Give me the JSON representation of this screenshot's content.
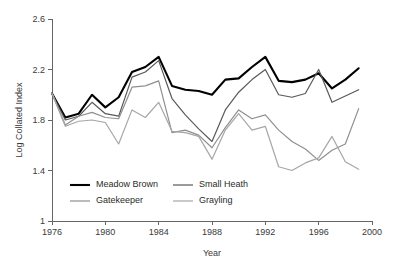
{
  "chart_data": {
    "type": "line",
    "title": "",
    "xlabel": "Year",
    "ylabel": "Log Collated Index",
    "xlim": [
      1976,
      2000
    ],
    "ylim": [
      1,
      2.6
    ],
    "xticks": [
      1976,
      1980,
      1984,
      1988,
      1992,
      1996,
      2000
    ],
    "yticks": [
      1,
      1.4,
      1.8,
      2.2,
      2.6
    ],
    "xtick_labels": [
      "1976",
      "1980",
      "1984",
      "1988",
      "1992",
      "1996",
      "2000"
    ],
    "ytick_labels": [
      "1",
      "1.4",
      "1.8",
      "2.2",
      "2.6"
    ],
    "grid": false,
    "legend_position": "inside-bottom-left",
    "x": [
      1976,
      1977,
      1978,
      1979,
      1980,
      1981,
      1982,
      1983,
      1984,
      1985,
      1986,
      1987,
      1988,
      1989,
      1990,
      1991,
      1992,
      1993,
      1994,
      1995,
      1996,
      1997,
      1998,
      1999
    ],
    "series": [
      {
        "name": "Meadow Brown",
        "color": "#000000",
        "width": 2.1,
        "values": [
          2.01,
          1.82,
          1.85,
          2.0,
          1.9,
          1.98,
          2.18,
          2.22,
          2.3,
          2.07,
          2.04,
          2.03,
          2.0,
          2.12,
          2.13,
          2.22,
          2.3,
          2.11,
          2.1,
          2.12,
          2.17,
          2.05,
          2.12,
          2.21
        ]
      },
      {
        "name": "Small Heath",
        "color": "#595959",
        "width": 1.2,
        "values": [
          2.01,
          1.8,
          1.83,
          1.94,
          1.85,
          1.83,
          2.14,
          2.18,
          2.27,
          1.97,
          1.84,
          1.73,
          1.63,
          1.88,
          2.02,
          2.12,
          2.2,
          2.0,
          1.98,
          2.01,
          2.2,
          1.94,
          1.99,
          2.04
        ]
      },
      {
        "name": "Gatekeeper",
        "color": "#8f8f8f",
        "width": 1.2,
        "values": [
          2.01,
          1.76,
          1.83,
          1.86,
          1.82,
          1.81,
          2.06,
          2.07,
          2.11,
          1.7,
          1.72,
          1.68,
          1.58,
          1.74,
          1.88,
          1.81,
          1.84,
          1.72,
          1.63,
          1.57,
          1.48,
          1.56,
          1.61,
          1.89
        ]
      },
      {
        "name": "Grayling",
        "color": "#a6a6a6",
        "width": 1.2,
        "values": [
          2.01,
          1.75,
          1.79,
          1.8,
          1.78,
          1.61,
          1.88,
          1.82,
          1.94,
          1.71,
          1.7,
          1.67,
          1.49,
          1.72,
          1.85,
          1.72,
          1.75,
          1.43,
          1.4,
          1.46,
          1.5,
          1.67,
          1.47,
          1.41
        ]
      }
    ],
    "legend": [
      {
        "label": "Meadow Brown",
        "color": "#000000",
        "width": 2.1
      },
      {
        "label": "Small Heath",
        "color": "#595959",
        "width": 1.2
      },
      {
        "label": "Gatekeeper",
        "color": "#8f8f8f",
        "width": 1.2
      },
      {
        "label": "Grayling",
        "color": "#a6a6a6",
        "width": 1.2
      }
    ]
  },
  "plot": {
    "left": 52,
    "right": 372,
    "top": 19,
    "bottom": 221
  },
  "legend_layout": {
    "cols_x": [
      70,
      173
    ],
    "rows_y": [
      185,
      201
    ],
    "swatch_len": 20,
    "text_gap": 6
  }
}
